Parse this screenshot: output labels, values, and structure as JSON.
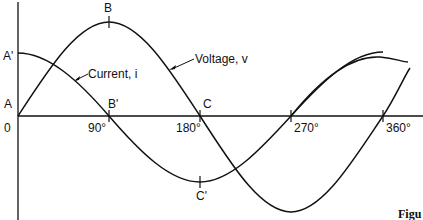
{
  "diagram": {
    "points": {
      "A": "A",
      "A_prime": "A'",
      "B": "B",
      "B_prime": "B'",
      "C": "C",
      "C_prime": "C'",
      "origin": "0"
    },
    "axis_ticks": [
      "90°",
      "180°",
      "270°",
      "360°"
    ],
    "curves": {
      "voltage": "Voltage, v",
      "current": "Current, i"
    },
    "caption_fragment": "Figu"
  }
}
